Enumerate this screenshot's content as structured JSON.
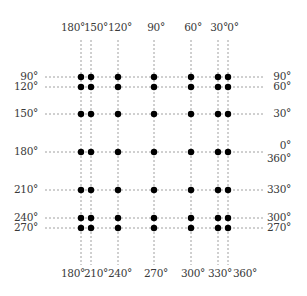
{
  "diagram": {
    "title": "",
    "colors": {
      "line": "#888888",
      "dot": "#000000",
      "text": "#3a3a3a"
    },
    "columns": [
      {
        "x": 81,
        "top": "180°",
        "bottom": "180°"
      },
      {
        "x": 91,
        "top": "150°",
        "bottom": "210°"
      },
      {
        "x": 118,
        "top": "120°",
        "bottom": "240°"
      },
      {
        "x": 154,
        "top": "90°",
        "bottom": "270°"
      },
      {
        "x": 191,
        "top": "60°",
        "bottom": "300°"
      },
      {
        "x": 218,
        "top": "30°",
        "bottom": "330°"
      },
      {
        "x": 228,
        "top": "0°",
        "bottom": "360°"
      }
    ],
    "rows": [
      {
        "y": 77,
        "left": "90°",
        "right": "90°"
      },
      {
        "y": 87,
        "left": "120°",
        "right": "60°"
      },
      {
        "y": 114,
        "left": "150°",
        "right": "30°"
      },
      {
        "y": 152,
        "left": "180°",
        "right": "0°",
        "right2": "360°"
      },
      {
        "y": 190,
        "left": "210°",
        "right": "330°"
      },
      {
        "y": 218,
        "left": "240°",
        "right": "300°"
      },
      {
        "y": 228,
        "left": "270°",
        "right": "270°"
      }
    ],
    "top_labels": [
      "180°",
      "150°",
      "120°",
      "90°",
      "60°",
      "30°",
      "0°"
    ],
    "bottom_labels": [
      "180°",
      "210°",
      "240°",
      "270°",
      "300°",
      "330°",
      "360°"
    ],
    "left_labels": [
      "90°",
      "120°",
      "150°",
      "180°",
      "210°",
      "240°",
      "270°"
    ],
    "right_labels": [
      "90°",
      "60°",
      "30°",
      "0°",
      "360°",
      "330°",
      "300°",
      "270°"
    ]
  }
}
